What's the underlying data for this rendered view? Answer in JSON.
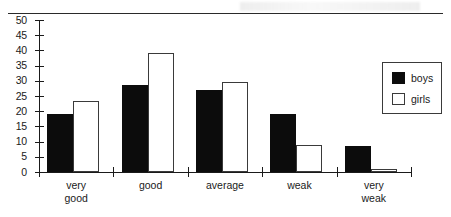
{
  "chart_data": {
    "type": "bar",
    "title": "",
    "subtitle": "",
    "xlabel": "",
    "ylabel": "",
    "categories": [
      "very\ngood",
      "good",
      "average",
      "weak",
      "very\nweak"
    ],
    "series": [
      {
        "name": "boys",
        "color": "#0c0c0c",
        "values": [
          19,
          28.5,
          27,
          19,
          8.5
        ]
      },
      {
        "name": "girls",
        "color": "#ffffff",
        "values": [
          23.5,
          39,
          29.5,
          9,
          1
        ]
      }
    ],
    "ylim": [
      0,
      50
    ],
    "ytick_step": 5,
    "yticks": [
      "50",
      "45",
      "40",
      "35",
      "30",
      "25",
      "20",
      "15",
      "10",
      "5",
      "0"
    ],
    "grid": false,
    "legend_position": "upper-right",
    "legend_entries": [
      "boys",
      "girls"
    ]
  },
  "legend": {
    "boys_label": "boys",
    "girls_label": "girls"
  }
}
